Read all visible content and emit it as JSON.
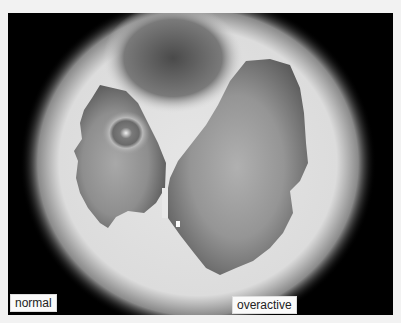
{
  "image": {
    "description": "grayscale brain scan comparing activity levels",
    "colors": {
      "background": "#f2f2f2",
      "scan_background": "#000000",
      "outer_glow": "#e8e8e8",
      "region_dark": "#555555",
      "region_mid": "#8a8a8a",
      "region_light": "#b4b4b4"
    }
  },
  "labels": {
    "normal": "normal",
    "overactive": "overactive"
  }
}
